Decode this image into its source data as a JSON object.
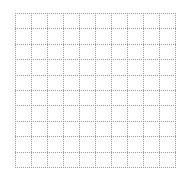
{
  "grid": {
    "columns": 10,
    "rows": 10,
    "line_color": "#9a9a9a",
    "background": "#ffffff",
    "line_style": "dotted"
  }
}
